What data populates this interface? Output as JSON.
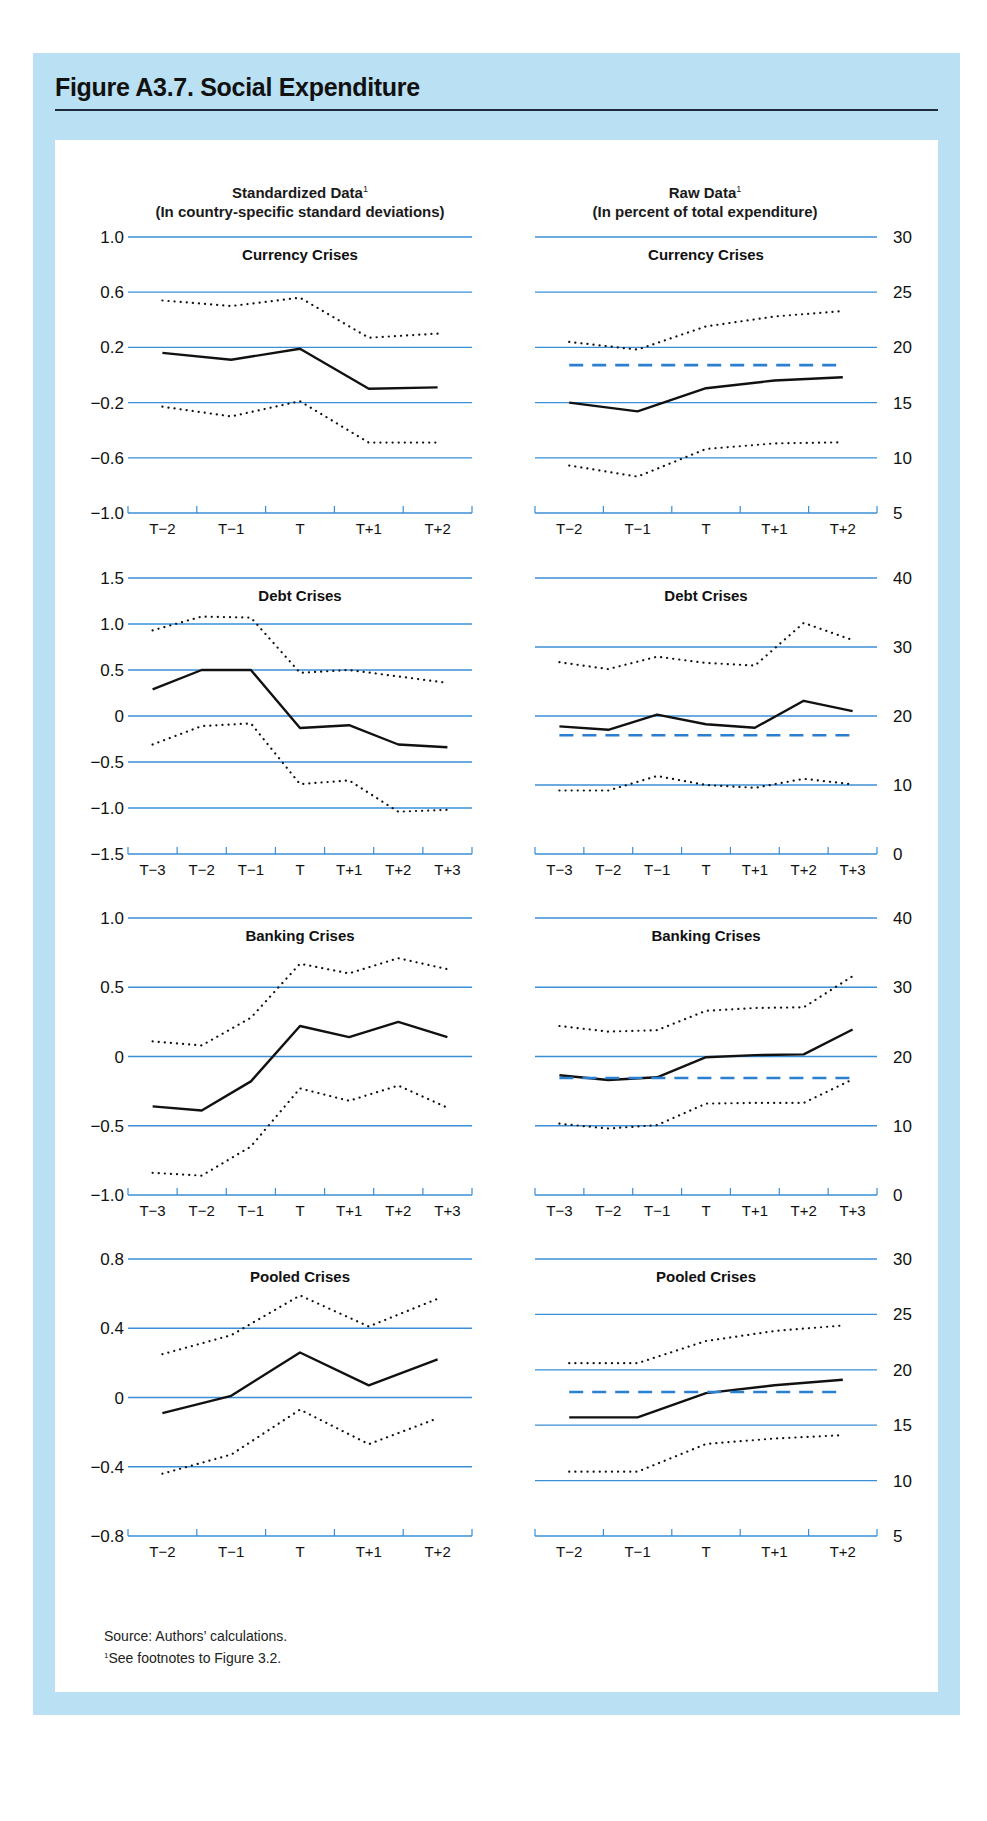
{
  "figure": {
    "title": "Figure A3.7. Social Expenditure",
    "left_header": {
      "title": "Standardized Data",
      "footnote_mark": "1",
      "subtitle": "(In country-specific standard deviations)"
    },
    "right_header": {
      "title": "Raw Data",
      "footnote_mark": "1",
      "subtitle": "(In percent of total expenditure)"
    },
    "source": "Source:  Authors’ calculations.",
    "footnote_mark": "1",
    "footnote": "See footnotes to Figure 3.2.",
    "colors": {
      "frame": "#b9e0f3",
      "gridline": "#3a8fd6",
      "series_line": "#111111",
      "average_dashed": "#2b7fd0",
      "rule": "#1d2a3a"
    }
  },
  "chart_data": [
    {
      "type": "line",
      "title": "Currency Crises",
      "panel": "standardized",
      "categories": [
        "T−2",
        "T−1",
        "T",
        "T+1",
        "T+2"
      ],
      "ylim": [
        -1.0,
        1.0
      ],
      "yticks": [
        1.0,
        0.6,
        0.2,
        -0.2,
        -0.6,
        -1.0
      ],
      "ytick_labels": [
        "1.0",
        "0.6",
        "0.2",
        "−0.2",
        "−0.6",
        "−1.0"
      ],
      "axis_side": "left",
      "grid": true,
      "series": [
        {
          "name": "Mean",
          "style": "solid",
          "values": [
            0.16,
            0.11,
            0.19,
            -0.1,
            -0.09
          ]
        },
        {
          "name": "Upper band",
          "style": "dotted",
          "values": [
            0.54,
            0.5,
            0.56,
            0.27,
            0.3
          ]
        },
        {
          "name": "Lower band",
          "style": "dotted",
          "values": [
            -0.23,
            -0.3,
            -0.19,
            -0.49,
            -0.49
          ]
        }
      ]
    },
    {
      "type": "line",
      "title": "Currency Crises",
      "panel": "raw",
      "categories": [
        "T−2",
        "T−1",
        "T",
        "T+1",
        "T+2"
      ],
      "ylim": [
        5,
        30
      ],
      "yticks": [
        30,
        25,
        20,
        15,
        10,
        5
      ],
      "ytick_labels": [
        "30",
        "25",
        "20",
        "15",
        "10",
        "5"
      ],
      "axis_side": "right",
      "grid": true,
      "series": [
        {
          "name": "Mean",
          "style": "solid",
          "values": [
            15.0,
            14.2,
            16.3,
            17.0,
            17.3
          ]
        },
        {
          "name": "Upper band",
          "style": "dotted",
          "values": [
            20.5,
            19.8,
            21.9,
            22.8,
            23.3
          ]
        },
        {
          "name": "Lower band",
          "style": "dotted",
          "values": [
            9.3,
            8.3,
            10.8,
            11.3,
            11.4
          ]
        },
        {
          "name": "Average",
          "style": "dashed",
          "values": [
            18.4,
            18.4,
            18.4,
            18.4,
            18.4
          ]
        }
      ]
    },
    {
      "type": "line",
      "title": "Debt Crises",
      "panel": "standardized",
      "categories": [
        "T−3",
        "T−2",
        "T−1",
        "T",
        "T+1",
        "T+2",
        "T+3"
      ],
      "ylim": [
        -1.5,
        1.5
      ],
      "yticks": [
        1.5,
        1.0,
        0.5,
        0,
        -0.5,
        -1.0,
        -1.5
      ],
      "ytick_labels": [
        "1.5",
        "1.0",
        "0.5",
        "0",
        "−0.5",
        "−1.0",
        "−1.5"
      ],
      "axis_side": "left",
      "grid": true,
      "series": [
        {
          "name": "Mean",
          "style": "solid",
          "values": [
            0.29,
            0.5,
            0.5,
            -0.13,
            -0.1,
            -0.31,
            -0.34
          ]
        },
        {
          "name": "Upper band",
          "style": "dotted",
          "values": [
            0.93,
            1.08,
            1.07,
            0.47,
            0.5,
            0.43,
            0.36
          ]
        },
        {
          "name": "Lower band",
          "style": "dotted",
          "values": [
            -0.31,
            -0.11,
            -0.08,
            -0.74,
            -0.7,
            -1.04,
            -1.02
          ]
        }
      ]
    },
    {
      "type": "line",
      "title": "Debt Crises",
      "panel": "raw",
      "categories": [
        "T−3",
        "T−2",
        "T−1",
        "T",
        "T+1",
        "T+2",
        "T+3"
      ],
      "ylim": [
        0,
        40
      ],
      "yticks": [
        40,
        30,
        20,
        10,
        0
      ],
      "ytick_labels": [
        "40",
        "30",
        "20",
        "10",
        "0"
      ],
      "axis_side": "right",
      "grid": true,
      "series": [
        {
          "name": "Mean",
          "style": "solid",
          "values": [
            18.5,
            18.0,
            20.2,
            18.8,
            18.3,
            22.2,
            20.7
          ]
        },
        {
          "name": "Upper band",
          "style": "dotted",
          "values": [
            27.8,
            26.8,
            28.6,
            27.7,
            27.3,
            33.5,
            31.0
          ]
        },
        {
          "name": "Lower band",
          "style": "dotted",
          "values": [
            9.2,
            9.2,
            11.3,
            10.0,
            9.6,
            10.9,
            10.1
          ]
        },
        {
          "name": "Average",
          "style": "dashed",
          "values": [
            17.2,
            17.2,
            17.2,
            17.2,
            17.2,
            17.2,
            17.2
          ]
        }
      ]
    },
    {
      "type": "line",
      "title": "Banking Crises",
      "panel": "standardized",
      "categories": [
        "T−3",
        "T−2",
        "T−1",
        "T",
        "T+1",
        "T+2",
        "T+3"
      ],
      "ylim": [
        -1.0,
        1.0
      ],
      "yticks": [
        1.0,
        0.5,
        0,
        -0.5,
        -1.0
      ],
      "ytick_labels": [
        "1.0",
        "0.5",
        "0",
        "−0.5",
        "−1.0"
      ],
      "axis_side": "left",
      "grid": true,
      "series": [
        {
          "name": "Mean",
          "style": "solid",
          "values": [
            -0.36,
            -0.39,
            -0.18,
            0.22,
            0.14,
            0.25,
            0.14
          ]
        },
        {
          "name": "Upper band",
          "style": "dotted",
          "values": [
            0.11,
            0.08,
            0.28,
            0.67,
            0.6,
            0.71,
            0.63
          ]
        },
        {
          "name": "Lower band",
          "style": "dotted",
          "values": [
            -0.84,
            -0.86,
            -0.65,
            -0.23,
            -0.32,
            -0.21,
            -0.37
          ]
        }
      ]
    },
    {
      "type": "line",
      "title": "Banking Crises",
      "panel": "raw",
      "categories": [
        "T−3",
        "T−2",
        "T−1",
        "T",
        "T+1",
        "T+2",
        "T+3"
      ],
      "ylim": [
        0,
        40
      ],
      "yticks": [
        40,
        30,
        20,
        10,
        0
      ],
      "ytick_labels": [
        "40",
        "30",
        "20",
        "10",
        "0"
      ],
      "axis_side": "right",
      "grid": true,
      "series": [
        {
          "name": "Mean",
          "style": "solid",
          "values": [
            17.3,
            16.6,
            17.0,
            19.9,
            20.2,
            20.3,
            23.9
          ]
        },
        {
          "name": "Upper band",
          "style": "dotted",
          "values": [
            24.4,
            23.6,
            23.8,
            26.6,
            27.0,
            27.1,
            31.6
          ]
        },
        {
          "name": "Lower band",
          "style": "dotted",
          "values": [
            10.3,
            9.6,
            10.1,
            13.2,
            13.3,
            13.3,
            16.7
          ]
        },
        {
          "name": "Average",
          "style": "dashed",
          "values": [
            16.9,
            16.9,
            16.9,
            16.9,
            16.9,
            16.9,
            16.9
          ]
        }
      ]
    },
    {
      "type": "line",
      "title": "Pooled Crises",
      "panel": "standardized",
      "categories": [
        "T−2",
        "T−1",
        "T",
        "T+1",
        "T+2"
      ],
      "ylim": [
        -0.8,
        0.8
      ],
      "yticks": [
        0.8,
        0.4,
        0,
        -0.4,
        -0.8
      ],
      "ytick_labels": [
        "0.8",
        "0.4",
        "0",
        "−0.4",
        "−0.8"
      ],
      "axis_side": "left",
      "grid": true,
      "series": [
        {
          "name": "Mean",
          "style": "solid",
          "values": [
            -0.09,
            0.01,
            0.26,
            0.07,
            0.22
          ]
        },
        {
          "name": "Upper band",
          "style": "dotted",
          "values": [
            0.25,
            0.36,
            0.59,
            0.41,
            0.57
          ]
        },
        {
          "name": "Lower band",
          "style": "dotted",
          "values": [
            -0.44,
            -0.33,
            -0.07,
            -0.27,
            -0.12
          ]
        }
      ]
    },
    {
      "type": "line",
      "title": "Pooled Crises",
      "panel": "raw",
      "categories": [
        "T−2",
        "T−1",
        "T",
        "T+1",
        "T+2"
      ],
      "ylim": [
        5,
        30
      ],
      "yticks": [
        30,
        25,
        20,
        15,
        10,
        5
      ],
      "ytick_labels": [
        "30",
        "25",
        "20",
        "15",
        "10",
        "5"
      ],
      "axis_side": "right",
      "grid": true,
      "series": [
        {
          "name": "Mean",
          "style": "solid",
          "values": [
            15.7,
            15.7,
            17.9,
            18.6,
            19.1
          ]
        },
        {
          "name": "Upper band",
          "style": "dotted",
          "values": [
            20.6,
            20.6,
            22.6,
            23.5,
            24.0
          ]
        },
        {
          "name": "Lower band",
          "style": "dotted",
          "values": [
            10.8,
            10.8,
            13.3,
            13.8,
            14.1
          ]
        },
        {
          "name": "Average",
          "style": "dashed",
          "values": [
            18.0,
            18.0,
            18.0,
            18.0,
            18.0
          ]
        }
      ]
    }
  ]
}
